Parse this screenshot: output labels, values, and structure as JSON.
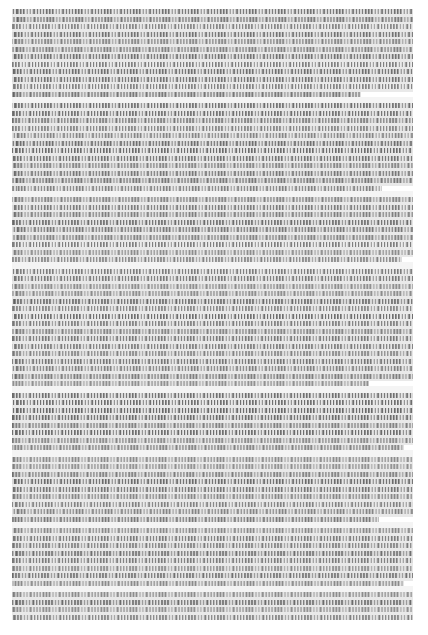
{
  "page": {
    "type": "document-page",
    "width": 428,
    "height": 635,
    "background_color": "#ffffff",
    "legible_text": false,
    "note_on_content": "Page is rendered far below glyph resolution; no character, word, heading, caption, page number, or other text is readable at any magnification, so no textual content is recorded."
  },
  "text_block": {
    "left": 12,
    "top": 9,
    "width": 401,
    "height": 611,
    "alignment": "justified",
    "columns": 1,
    "first_line_indent": 0,
    "line_pitch": 7.5,
    "line_height": 5.0,
    "ink_color": "#9a9a9a",
    "line_gap_color": "#e9e9e9",
    "paragraph_gap_color": "#f4f4f4",
    "paragraph_gap": 4
  },
  "paragraphs": [
    {
      "lines": 12
    },
    {
      "lines": 12
    },
    {
      "lines": 9
    },
    {
      "lines": 16
    },
    {
      "lines": 8
    },
    {
      "lines": 9
    },
    {
      "lines": 8
    },
    {
      "lines": 7
    }
  ]
}
